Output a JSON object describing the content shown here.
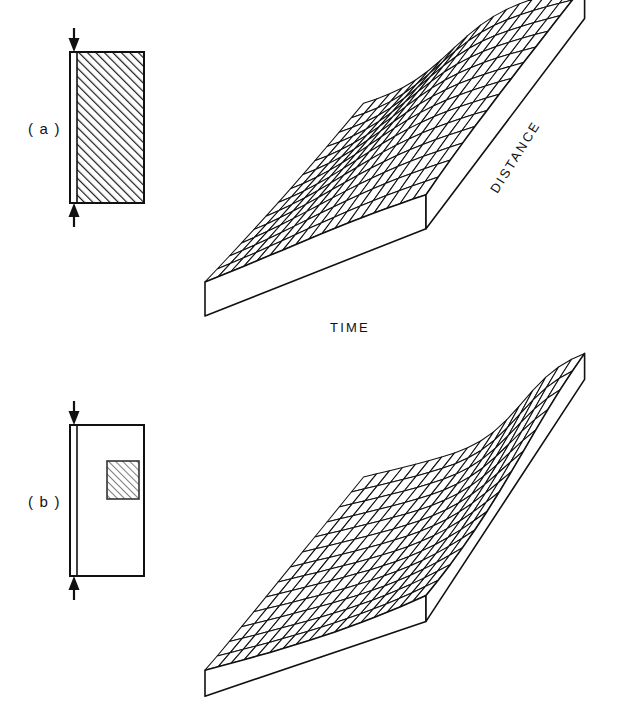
{
  "figure": {
    "background": "#ffffff",
    "ink": "#000000",
    "width": 619,
    "height": 719
  },
  "panels": [
    {
      "id": "a",
      "label": "( a )",
      "schematic": {
        "name": "source-region-full",
        "description": "rectangle fully hatched",
        "rect": {
          "x": 70,
          "y": 52,
          "w": 74,
          "h": 151
        },
        "hatch_angle_deg": 45,
        "hatch_spacing": 4.2,
        "inner_strip_x": 7,
        "hatched_region": {
          "x": 77,
          "y": 55,
          "w": 64,
          "h": 145
        },
        "arrows": [
          {
            "name": "top-arrow",
            "direction": "down",
            "x": 74,
            "y_start": 28,
            "y_end": 50
          },
          {
            "name": "bottom-arrow",
            "direction": "up",
            "x": 74,
            "y_start": 227,
            "y_end": 205
          }
        ]
      },
      "surface": {
        "name": "mesh-surface-broad-front",
        "axis_labels": {
          "time": "TIME",
          "distance": "DISTANCE"
        },
        "grid_cols": 17,
        "grid_rows": 13,
        "front_step_center": 0.34,
        "back_step_center": 0.4,
        "front_sharpness": 2.6,
        "back_sharpness": 9.0,
        "amplitude": 62,
        "plateau_tilt": 10
      }
    },
    {
      "id": "b",
      "label": "( b )",
      "schematic": {
        "name": "source-region-localized",
        "description": "rectangle with small hatched square inset",
        "rect": {
          "x": 70,
          "y": 425,
          "w": 74,
          "h": 151
        },
        "inner_strip_x": 7,
        "inset": {
          "x": 107,
          "y": 461,
          "w": 32,
          "h": 38
        },
        "inset_hatch_angle_deg": 45,
        "inset_hatch_spacing": 3.4,
        "arrows": [
          {
            "name": "top-arrow",
            "direction": "down",
            "x": 74,
            "y_start": 401,
            "y_end": 423
          },
          {
            "name": "bottom-arrow",
            "direction": "up",
            "x": 74,
            "y_start": 600,
            "y_end": 578
          }
        ]
      },
      "surface": {
        "name": "mesh-surface-corner-peak",
        "axis_labels": {
          "time": "",
          "distance": ""
        },
        "grid_cols": 17,
        "grid_rows": 13,
        "front_step_center": 1.22,
        "back_step_center": 0.72,
        "front_sharpness": 3.0,
        "back_sharpness": 11.0,
        "amplitude": 70,
        "plateau_tilt": 6
      }
    }
  ],
  "chart_data": {
    "type": "surface",
    "title": "",
    "xlabel": "TIME",
    "ylabel": "DISTANCE",
    "zlabel": "",
    "grid": true,
    "legend": null,
    "panels": [
      {
        "panel": "a",
        "note": "wavefront rises across full time axis; step front broad near viewer, sharp at far distance",
        "z_profile_front_row": [
          0,
          0,
          0,
          0,
          0,
          0.04,
          0.15,
          0.38,
          0.66,
          0.85,
          0.93,
          0.96,
          0.98,
          0.99,
          1,
          1,
          1
        ],
        "z_profile_back_row": [
          0,
          0,
          0,
          0,
          0,
          0,
          0.02,
          0.25,
          0.82,
          0.97,
          1,
          1,
          1,
          1,
          1,
          1,
          1
        ]
      },
      {
        "panel": "b",
        "note": "surface nearly flat; rise confined to far-distance, late-time corner",
        "z_profile_front_row": [
          0,
          0,
          0,
          0,
          0,
          0,
          0,
          0,
          0,
          0,
          0,
          0,
          0,
          0,
          0.01,
          0.03,
          0.06
        ],
        "z_profile_back_row": [
          0,
          0,
          0,
          0,
          0,
          0,
          0,
          0.02,
          0.08,
          0.22,
          0.45,
          0.7,
          0.88,
          0.96,
          0.99,
          1,
          1
        ]
      }
    ]
  }
}
